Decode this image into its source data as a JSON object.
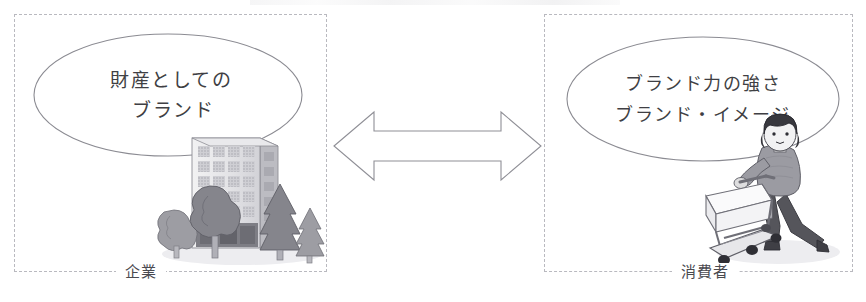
{
  "diagram": {
    "title_clipped": true,
    "panels": [
      {
        "id": "company",
        "label": "企業",
        "bubble_lines": [
          "財産としての",
          "ブランド"
        ],
        "illustration": "office-building-with-trees"
      },
      {
        "id": "consumer",
        "label": "消費者",
        "bubble_lines": [
          "ブランド力の強さ",
          "ブランド・イメージ"
        ],
        "illustration": "woman-pushing-shopping-cart"
      }
    ],
    "connector": {
      "icon": "double-headed-arrow",
      "direction": "bidirectional"
    },
    "colors": {
      "background": "#ffffff",
      "panel_border": "#b9b9bf",
      "bubble_stroke": "#8b8b92",
      "arrow_stroke": "#8f8f96",
      "text": "#3f3f44",
      "label_text": "#4a4a4f",
      "art_dark": "#4a4a4e",
      "art_mid": "#9a9aa0",
      "art_light": "#d9d9de"
    }
  }
}
